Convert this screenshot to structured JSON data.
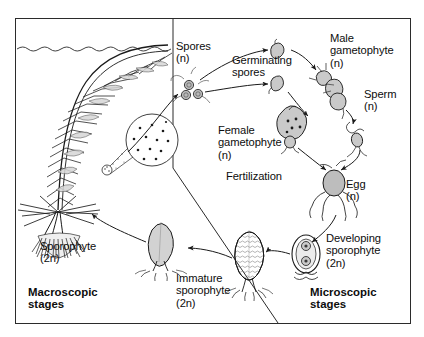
{
  "figure": {
    "background_color": "#ffffff",
    "frame_color": "#2b2b2b",
    "ink_color": "#1a1a1a",
    "fill_gray": "#c9c9c9"
  },
  "sections": {
    "macroscopic": {
      "label": "Macroscopic\nstages",
      "x": 30,
      "y": 286
    },
    "microscopic": {
      "label": "Microscopic\nstages",
      "x": 310,
      "y": 286
    }
  },
  "stages": [
    {
      "id": "spores",
      "label": "Spores\n(n)",
      "x": 176,
      "y": 40,
      "align": "left"
    },
    {
      "id": "germinating-spores",
      "label": "Germinating\nspores",
      "x": 232,
      "y": 54,
      "align": "left"
    },
    {
      "id": "male-gametophyte",
      "label": "Male\ngametophyte\n(n)",
      "x": 330,
      "y": 32,
      "align": "left"
    },
    {
      "id": "sperm",
      "label": "Sperm\n(n)",
      "x": 364,
      "y": 88,
      "align": "left"
    },
    {
      "id": "female-gametophyte",
      "label": "Female\ngametophyte\n(n)",
      "x": 244,
      "y": 124,
      "align": "left"
    },
    {
      "id": "fertilization",
      "label": "Fertilization",
      "x": 240,
      "y": 170,
      "align": "left"
    },
    {
      "id": "egg",
      "label": "Egg\n(n)",
      "x": 344,
      "y": 180,
      "align": "left"
    },
    {
      "id": "developing-sporophyte",
      "label": "Developing\nsporophyte\n(2n)",
      "x": 327,
      "y": 232,
      "align": "left"
    },
    {
      "id": "immature-sporophyte",
      "label": "Immature\nsporophyte\n(2n)",
      "x": 178,
      "y": 272,
      "align": "left"
    },
    {
      "id": "sporophyte",
      "label": "Sporophyte\n(2n)",
      "x": 40,
      "y": 240,
      "align": "left"
    }
  ],
  "annotations": {
    "waterline": "wavy water surface line",
    "sporangium_inset": "magnified sporangium containing spores",
    "divider": "diagonal line separating macroscopic and microscopic stages"
  }
}
